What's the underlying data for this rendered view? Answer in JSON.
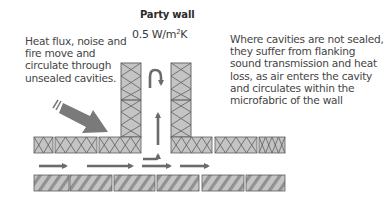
{
  "diagram": {
    "title": "Party wall",
    "u_value": {
      "prefix": "0.5 W/m",
      "superscript": "2",
      "suffix": "K"
    },
    "left_note": {
      "lines": [
        "Heat flux, noise and",
        "fire move and",
        "circulate through",
        "unsealed cavities."
      ]
    },
    "right_note": {
      "lines": [
        "Where cavities are not sealed,",
        "they suffer from flanking",
        "sound transmission and heat",
        "loss, as air enters the cavity",
        "and circulates within the",
        "microfabric of the wall"
      ]
    },
    "colors": {
      "block_fill": "#c4c4c4",
      "block_stroke": "#5e5e5e",
      "arrow": "#6b6b6b",
      "text": "#454545"
    },
    "elements": {
      "party_wall_columns": 2,
      "upper_insulated_blocks": 6,
      "lower_hatched_blocks": 6,
      "airflow_arrows": [
        "horizontal",
        "horizontal",
        "horizontal",
        "horizontal",
        "elbow-up",
        "vertical-up",
        "u-turn"
      ],
      "heat_flux_arrow": "diagonal-large"
    }
  }
}
